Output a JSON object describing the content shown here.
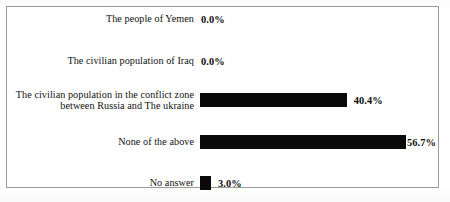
{
  "chart_data": {
    "type": "bar",
    "orientation": "horizontal",
    "title": "",
    "xlabel": "",
    "ylabel": "",
    "grid": false,
    "legend": null,
    "value_suffix": "%",
    "xlim": [
      0,
      60
    ],
    "categories": [
      "The people of Yemen",
      "The civilian population of Iraq",
      "The civilian population in the conflict zone\nbetween Russia and The ukraine",
      "None of the above",
      "No answer"
    ],
    "values": [
      0.0,
      0.0,
      40.4,
      56.7,
      3.0
    ],
    "value_labels": [
      "0.0%",
      "0.0%",
      "40.4%",
      "56.7%",
      "3.0%"
    ],
    "bar_color": "#0a0a0a",
    "frame_color": "#9a9a9a",
    "background_color": "#ffffff"
  },
  "rows": [
    {
      "label": "The people of Yemen",
      "value_label": "0.0%",
      "value": 0.0,
      "top": 8
    },
    {
      "label": "The civilian population of Iraq",
      "value_label": "0.0%",
      "value": 0.0,
      "top": 50
    },
    {
      "label": "The civilian population in the conflict zone\nbetween Russia and The ukraine",
      "value_label": "40.4%",
      "value": 40.4,
      "top": 87
    },
    {
      "label": "None of the above",
      "value_label": "56.7%",
      "value": 56.7,
      "top": 131
    },
    {
      "label": "No answer",
      "value_label": "3.0%",
      "value": 3.0,
      "top": 172
    }
  ]
}
